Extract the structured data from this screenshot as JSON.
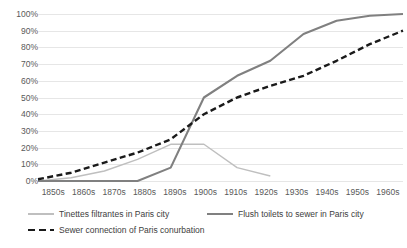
{
  "chart_data": {
    "type": "line",
    "title": "",
    "xlabel": "",
    "ylabel": "",
    "ylim": [
      0,
      100
    ],
    "ytick_format": "percent",
    "grid": true,
    "legend_position": "bottom",
    "categories": [
      "1850s",
      "1860s",
      "1870s",
      "1880s",
      "1890s",
      "1900s",
      "1910s",
      "1920s",
      "1930s",
      "1940s",
      "1950s",
      "1960s"
    ],
    "yticks": [
      "0%",
      "10%",
      "20%",
      "30%",
      "40%",
      "50%",
      "60%",
      "70%",
      "80%",
      "90%",
      "100%"
    ],
    "ytick_values": [
      0,
      10,
      20,
      30,
      40,
      50,
      60,
      70,
      80,
      90,
      100
    ],
    "series": [
      {
        "name": "Tinettes filtrantes in Paris city",
        "color": "#BFBFBF",
        "style": "solid",
        "width": 1.4,
        "values": [
          0,
          2,
          6,
          13,
          22,
          22,
          8,
          3,
          null,
          null,
          null,
          null
        ]
      },
      {
        "name": "Flush toilets to sewer in Paris city",
        "color": "#808080",
        "style": "solid",
        "width": 2.1,
        "values": [
          0,
          0,
          0,
          0,
          8,
          50,
          63,
          72,
          88,
          96,
          99,
          100
        ]
      },
      {
        "name": "Sewer connection of Paris conurbation",
        "color": "#1A1A1A",
        "style": "dashed",
        "width": 2.4,
        "values": [
          1,
          5,
          11,
          17,
          25,
          40,
          50,
          57,
          63,
          72,
          82,
          90
        ]
      }
    ]
  },
  "legend": {
    "items": [
      {
        "label": "Tinettes filtrantes in Paris city"
      },
      {
        "label": "Flush toilets to sewer in Paris city"
      },
      {
        "label": "Sewer connection of Paris conurbation"
      }
    ]
  },
  "colors": {
    "gridline": "#E6E6E6",
    "axis_text": "#595959",
    "legend_text": "#404040",
    "background": "#FFFFFF"
  }
}
